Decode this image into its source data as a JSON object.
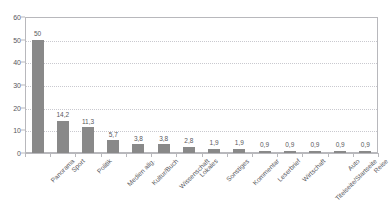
{
  "chart_data": {
    "type": "bar",
    "title": "",
    "subtitle": "",
    "xlabel": "",
    "ylabel": "",
    "ylim": [
      0,
      60
    ],
    "yticks": [
      0,
      10,
      20,
      30,
      40,
      50,
      60
    ],
    "ytick_labels": [
      "0",
      "10",
      "20",
      "30",
      "40",
      "50",
      "60"
    ],
    "grid": true,
    "grid_style": "dotted-horizontal",
    "legend": "none",
    "bar_color": "#898989",
    "axis_color": "#b8b8bc",
    "text_color": "#58585c",
    "decimal_separator": ",",
    "categories": [
      "Panorama",
      "Sport",
      "Politik",
      "Medien allg.",
      "Kultur/Buch",
      "Wissenschaft",
      "Lokales",
      "Sonstiges",
      "Kommentar",
      "Leserbrief",
      "Wirtschaft",
      "Titelseite/Startseite",
      "Auto",
      "Reise"
    ],
    "values": [
      50,
      14.2,
      11.3,
      5.7,
      3.8,
      3.8,
      2.8,
      1.9,
      1.9,
      0.9,
      0.9,
      0.9,
      0.9,
      0.9
    ],
    "value_labels": [
      "50",
      "14,2",
      "11,3",
      "5,7",
      "3,8",
      "3,8",
      "2,8",
      "1,9",
      "1,9",
      "0,9",
      "0,9",
      "0,9",
      "0,9",
      "0,9"
    ]
  }
}
